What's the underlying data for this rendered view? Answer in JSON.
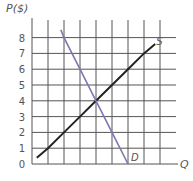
{
  "chart_data": {
    "type": "line",
    "title": "",
    "xlabel": "Q",
    "ylabel": "P($)",
    "xlim": [
      0,
      8
    ],
    "ylim": [
      0,
      8
    ],
    "grid": true,
    "y_ticks": [
      "0",
      "1",
      "2",
      "3",
      "4",
      "5",
      "6",
      "7",
      "8"
    ],
    "x_ticks": [],
    "series": [
      {
        "name": "S",
        "label": "S",
        "color": "#222222",
        "points": [
          [
            0.3,
            0.4
          ],
          [
            1,
            1
          ],
          [
            2,
            2
          ],
          [
            3,
            3
          ],
          [
            4,
            4
          ],
          [
            5,
            5
          ],
          [
            6,
            6
          ],
          [
            7,
            7
          ],
          [
            7.7,
            7.6
          ]
        ]
      },
      {
        "name": "D",
        "label": "D",
        "color": "#7b78b0",
        "points": [
          [
            1.8,
            8.5
          ],
          [
            2,
            8
          ],
          [
            3,
            6
          ],
          [
            4,
            4
          ],
          [
            5,
            2
          ],
          [
            6,
            0
          ]
        ]
      }
    ],
    "annotations": [
      {
        "text": "Equilibrium intersection",
        "x": 4,
        "y": 4
      }
    ]
  },
  "labels": {
    "y_axis": "P($)",
    "x_axis": "Q",
    "supply": "S",
    "demand": "D"
  }
}
